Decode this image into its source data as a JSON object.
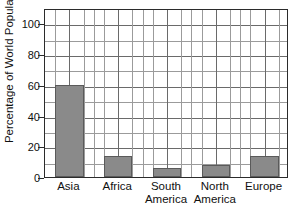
{
  "chart_data": {
    "type": "bar",
    "title": "",
    "xlabel": "",
    "ylabel": "Percentage of World Population",
    "categories": [
      "Asia",
      "Africa",
      "South America",
      "North America",
      "Europe"
    ],
    "category_lines": [
      [
        "Asia"
      ],
      [
        "Africa"
      ],
      [
        "South",
        "America"
      ],
      [
        "North",
        "America"
      ],
      [
        "Europe"
      ]
    ],
    "values": [
      60,
      14,
      6,
      8,
      14
    ],
    "ylim": [
      0,
      110
    ],
    "yticks": [
      0,
      20,
      40,
      60,
      80,
      100
    ],
    "ytick_labels": [
      "0",
      "20",
      "40",
      "60",
      "80",
      "100"
    ],
    "minor_ytick_step": 10,
    "grid": true,
    "legend": false,
    "bar_color": "#8a8a8a",
    "bar_border_color": "#5a5a5a",
    "grid_color": "#9b9b9b",
    "frame_color": "#2b2b2b",
    "background": "#ffffff"
  }
}
